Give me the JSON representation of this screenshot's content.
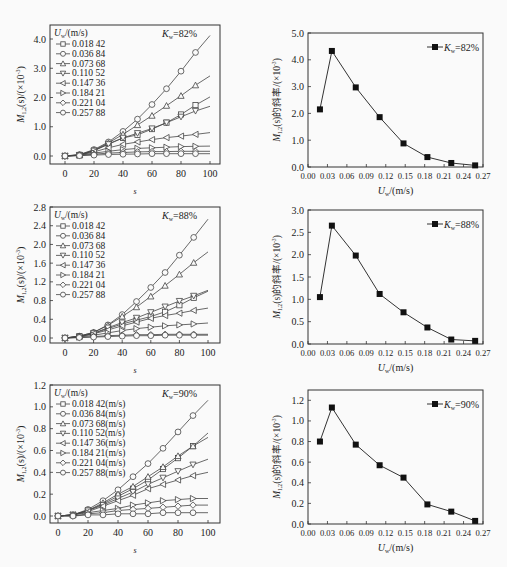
{
  "chart_data": [
    {
      "id": "p1",
      "type": "line",
      "title": "",
      "annotation": "K_w=82%",
      "xlabel": "s",
      "ylabel": "M_{1,2}(s)/(×10^{-3})",
      "xlim": [
        0,
        100
      ],
      "ylim": [
        0,
        4.0
      ],
      "xticks": [
        0,
        20,
        40,
        60,
        80,
        100
      ],
      "yticks": [
        "0.0",
        "1.0",
        "2.0",
        "3.0",
        "4.0"
      ],
      "legend_title": "U_w/(m/s)",
      "x": [
        0,
        10,
        20,
        30,
        40,
        50,
        60,
        70,
        80,
        90,
        100
      ],
      "series": [
        {
          "name": "0.018 42",
          "marker": "square",
          "values": [
            0,
            0.03,
            0.18,
            0.42,
            0.62,
            0.72,
            0.92,
            1.14,
            1.42,
            1.74,
            2.02
          ]
        },
        {
          "name": "0.036 84",
          "marker": "circle",
          "values": [
            0,
            0.05,
            0.22,
            0.48,
            0.84,
            1.26,
            1.76,
            2.3,
            2.9,
            3.54,
            4.12
          ]
        },
        {
          "name": "0.073 68",
          "marker": "tri-up",
          "values": [
            0,
            0.04,
            0.2,
            0.45,
            0.74,
            1.06,
            1.38,
            1.72,
            2.06,
            2.42,
            2.74
          ]
        },
        {
          "name": "0.110 52",
          "marker": "tri-down",
          "values": [
            0,
            0.03,
            0.18,
            0.4,
            0.62,
            0.78,
            0.94,
            1.14,
            1.34,
            1.54,
            1.7
          ]
        },
        {
          "name": "0.147 36",
          "marker": "tri-left",
          "values": [
            0,
            0.03,
            0.14,
            0.28,
            0.4,
            0.48,
            0.56,
            0.63,
            0.68,
            0.74,
            0.8
          ]
        },
        {
          "name": "0.184 21",
          "marker": "tri-right",
          "values": [
            0,
            0.02,
            0.1,
            0.16,
            0.22,
            0.26,
            0.28,
            0.3,
            0.32,
            0.33,
            0.34
          ]
        },
        {
          "name": "0.221 04",
          "marker": "diamond",
          "values": [
            0,
            0.02,
            0.06,
            0.1,
            0.12,
            0.14,
            0.15,
            0.15,
            0.16,
            0.16,
            0.16
          ]
        },
        {
          "name": "0.257 88",
          "marker": "circle",
          "values": [
            0,
            0.01,
            0.03,
            0.05,
            0.06,
            0.07,
            0.08,
            0.08,
            0.08,
            0.08,
            0.08
          ]
        }
      ]
    },
    {
      "id": "p2",
      "type": "line",
      "title": "",
      "xlabel": "U_w/(m/s)",
      "ylabel": "M_{1,2}(s)的斜率/(×10^{-3})",
      "xlim": [
        0,
        0.27
      ],
      "ylim": [
        0,
        5.0
      ],
      "xticks": [
        "0.00",
        "0.03",
        "0.06",
        "0.09",
        "0.12",
        "0.15",
        "0.18",
        "0.21",
        "0.24",
        "0.27"
      ],
      "yticks": [
        "0.0",
        "1.0",
        "2.0",
        "3.0",
        "4.0",
        "5.0"
      ],
      "legend": [
        "K_w=82%"
      ],
      "x": [
        0.01842,
        0.03684,
        0.07368,
        0.11052,
        0.14736,
        0.18421,
        0.22104,
        0.25788
      ],
      "series": [
        {
          "name": "K_w=82%",
          "marker": "filled-square",
          "values": [
            2.15,
            4.33,
            2.97,
            1.86,
            0.88,
            0.37,
            0.15,
            0.06
          ]
        }
      ]
    },
    {
      "id": "p3",
      "type": "line",
      "title": "",
      "annotation": "K_w=88%",
      "xlabel": "s",
      "ylabel": "M_{1,2}(s)/(×10^{-3})",
      "xlim": [
        0,
        100
      ],
      "ylim": [
        0,
        2.8
      ],
      "xticks": [
        0,
        20,
        40,
        60,
        80,
        100
      ],
      "yticks": [
        "0.0",
        "0.4",
        "0.8",
        "1.2",
        "1.6",
        "2.0",
        "2.4",
        "2.8"
      ],
      "legend_title": "U_w/(m/s)",
      "x": [
        0,
        10,
        20,
        30,
        40,
        50,
        60,
        70,
        80,
        90,
        100
      ],
      "series": [
        {
          "name": "0.018 42",
          "marker": "square",
          "values": [
            0,
            0.03,
            0.1,
            0.2,
            0.3,
            0.38,
            0.46,
            0.56,
            0.7,
            0.86,
            1.0
          ]
        },
        {
          "name": "0.036 84",
          "marker": "circle",
          "values": [
            0,
            0.04,
            0.12,
            0.28,
            0.5,
            0.78,
            1.08,
            1.4,
            1.77,
            2.15,
            2.54
          ]
        },
        {
          "name": "0.073 68",
          "marker": "tri-up",
          "values": [
            0,
            0.04,
            0.12,
            0.27,
            0.46,
            0.66,
            0.89,
            1.12,
            1.36,
            1.61,
            1.84
          ]
        },
        {
          "name": "0.110 52",
          "marker": "tri-down",
          "values": [
            0,
            0.03,
            0.1,
            0.22,
            0.33,
            0.43,
            0.55,
            0.67,
            0.79,
            0.9,
            1.02
          ]
        },
        {
          "name": "0.147 36",
          "marker": "tri-left",
          "values": [
            0,
            0.03,
            0.09,
            0.17,
            0.26,
            0.34,
            0.42,
            0.48,
            0.53,
            0.59,
            0.64
          ]
        },
        {
          "name": "0.184 21",
          "marker": "tri-right",
          "values": [
            0,
            0.02,
            0.06,
            0.11,
            0.16,
            0.2,
            0.23,
            0.26,
            0.28,
            0.3,
            0.32
          ]
        },
        {
          "name": "0.221 04",
          "marker": "diamond",
          "values": [
            0,
            0.01,
            0.03,
            0.05,
            0.06,
            0.07,
            0.07,
            0.08,
            0.08,
            0.08,
            0.08
          ]
        },
        {
          "name": "0.257 88",
          "marker": "circle",
          "values": [
            0,
            0.01,
            0.02,
            0.03,
            0.04,
            0.05,
            0.05,
            0.06,
            0.06,
            0.06,
            0.06
          ]
        }
      ]
    },
    {
      "id": "p4",
      "type": "line",
      "title": "",
      "xlabel": "U_w/(m/s)",
      "ylabel": "M_{1,2}(s)的斜率/(×10^{-3})",
      "xlim": [
        0,
        0.27
      ],
      "ylim": [
        0,
        3.0
      ],
      "xticks": [
        "0.00",
        "0.03",
        "0.06",
        "0.09",
        "0.12",
        "0.15",
        "0.18",
        "0.21",
        "0.24",
        "0.27"
      ],
      "yticks": [
        "0.0",
        "0.5",
        "1.0",
        "1.5",
        "2.0",
        "2.5",
        "3.0"
      ],
      "legend": [
        "K_w=88%"
      ],
      "x": [
        0.01842,
        0.03684,
        0.07368,
        0.11052,
        0.14736,
        0.18421,
        0.22104,
        0.25788
      ],
      "series": [
        {
          "name": "K_w=88%",
          "marker": "filled-square",
          "values": [
            1.05,
            2.65,
            1.98,
            1.12,
            0.71,
            0.37,
            0.1,
            0.07
          ]
        }
      ]
    },
    {
      "id": "p5",
      "type": "line",
      "title": "",
      "annotation": "K_w=90%",
      "xlabel": "s",
      "ylabel": "M_{1,2}(s)/(×10^{-3})",
      "xlim": [
        0,
        100
      ],
      "ylim": [
        0,
        1.2
      ],
      "xticks": [
        0,
        20,
        40,
        60,
        80,
        100
      ],
      "yticks": [
        "0.0",
        "0.2",
        "0.4",
        "0.6",
        "0.8",
        "1.0",
        "1.2"
      ],
      "legend_title": "U_w/(m/s)",
      "x": [
        0,
        10,
        20,
        30,
        40,
        50,
        60,
        70,
        80,
        90,
        100
      ],
      "series": [
        {
          "name": "0.018 42(m/s)",
          "marker": "square",
          "values": [
            0,
            0.01,
            0.05,
            0.11,
            0.18,
            0.25,
            0.33,
            0.43,
            0.53,
            0.64,
            0.76
          ]
        },
        {
          "name": "0.036 84(m/s)",
          "marker": "circle",
          "values": [
            0,
            0.01,
            0.06,
            0.14,
            0.24,
            0.36,
            0.48,
            0.62,
            0.77,
            0.92,
            1.06
          ]
        },
        {
          "name": "0.073 68(m/s)",
          "marker": "tri-up",
          "values": [
            0,
            0.01,
            0.05,
            0.12,
            0.2,
            0.27,
            0.36,
            0.45,
            0.55,
            0.64,
            0.72
          ]
        },
        {
          "name": "0.110 52(m/s)",
          "marker": "tri-down",
          "values": [
            0,
            0.01,
            0.05,
            0.1,
            0.16,
            0.22,
            0.29,
            0.35,
            0.41,
            0.47,
            0.52
          ]
        },
        {
          "name": "0.147 36(m/s)",
          "marker": "tri-left",
          "values": [
            0,
            0.01,
            0.04,
            0.09,
            0.14,
            0.19,
            0.25,
            0.29,
            0.33,
            0.37,
            0.4
          ]
        },
        {
          "name": "0.184 21(m/s)",
          "marker": "tri-right",
          "values": [
            0,
            0.01,
            0.03,
            0.05,
            0.07,
            0.1,
            0.12,
            0.14,
            0.15,
            0.16,
            0.16
          ]
        },
        {
          "name": "0.221 04(m/s)",
          "marker": "diamond",
          "values": [
            0,
            0.0,
            0.02,
            0.03,
            0.05,
            0.06,
            0.07,
            0.08,
            0.09,
            0.1,
            0.1
          ]
        },
        {
          "name": "0.257 88(m/s)",
          "marker": "circle",
          "values": [
            0,
            0.0,
            0.01,
            0.01,
            0.02,
            0.02,
            0.02,
            0.03,
            0.03,
            0.03,
            0.03
          ]
        }
      ]
    },
    {
      "id": "p6",
      "type": "line",
      "title": "",
      "xlabel": "U_w/(m/s)",
      "ylabel": "M_{1,2}(s)的斜率/(×10^{-3})",
      "xlim": [
        0,
        0.27
      ],
      "ylim": [
        0,
        1.3
      ],
      "xticks": [
        "0.00",
        "0.03",
        "0.06",
        "0.09",
        "0.12",
        "0.15",
        "0.18",
        "0.21",
        "0.24",
        "0.27"
      ],
      "yticks": [
        "0.0",
        "0.2",
        "0.4",
        "0.6",
        "0.8",
        "1.0",
        "1.2"
      ],
      "legend": [
        "K_w=90%"
      ],
      "x": [
        0.01842,
        0.03684,
        0.07368,
        0.11052,
        0.14736,
        0.18421,
        0.22104,
        0.25788
      ],
      "series": [
        {
          "name": "K_w=90%",
          "marker": "filled-square",
          "values": [
            0.8,
            1.13,
            0.77,
            0.57,
            0.45,
            0.19,
            0.12,
            0.03
          ]
        }
      ]
    }
  ],
  "labels": {
    "left_ylabel_main": "M",
    "left_ylabel_sub": "1,2",
    "left_ylabel_rest": "(s)/(×10",
    "left_ylabel_exp": "-3",
    "left_ylabel_end": ")",
    "right_ylabel_main": "M",
    "right_ylabel_sub": "1,2",
    "right_ylabel_rest": "(s)的斜率/(×10",
    "right_ylabel_exp": "-3",
    "right_ylabel_end": ")",
    "s_label": "s",
    "uw_label_main": "U",
    "uw_label_sub": "w",
    "uw_label_rest": "/(m/s)",
    "kw_main": "K",
    "kw_sub": "w"
  }
}
